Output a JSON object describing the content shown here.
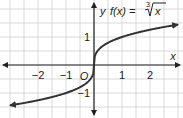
{
  "chart_data": {
    "type": "line",
    "function_label": "f(x) = ",
    "radical_index": "3",
    "radicand": "x",
    "xlabel": "x",
    "ylabel": "y",
    "origin_label": "O",
    "xlim": [
      -3.0,
      3.0
    ],
    "ylim": [
      -1.6,
      2.3
    ],
    "grid": true,
    "grid_step": 0.5,
    "x_ticks": [
      {
        "value": -2,
        "label": "−2"
      },
      {
        "value": -1,
        "label": "−1"
      },
      {
        "value": 1,
        "label": "1"
      },
      {
        "value": 2,
        "label": "2"
      }
    ],
    "y_ticks": [
      {
        "value": 1,
        "label": "1"
      },
      {
        "value": -1,
        "label": "−1"
      }
    ],
    "series": [
      {
        "name": "f(x) = ∛x",
        "x": [
          -3,
          -2.5,
          -2,
          -1.5,
          -1,
          -0.5,
          -0.25,
          -0.1,
          -0.02,
          0,
          0.02,
          0.1,
          0.25,
          0.5,
          1,
          1.5,
          2,
          2.5,
          3
        ],
        "y": [
          -1.442,
          -1.357,
          -1.26,
          -1.145,
          -1,
          -0.794,
          -0.63,
          -0.464,
          -0.271,
          0,
          0.271,
          0.464,
          0.63,
          0.794,
          1,
          1.145,
          1.26,
          1.357,
          1.442
        ],
        "arrows": "both"
      }
    ],
    "colors": {
      "curve": "#333333",
      "axes": "#222222",
      "grid": "#cfcfcf"
    }
  }
}
